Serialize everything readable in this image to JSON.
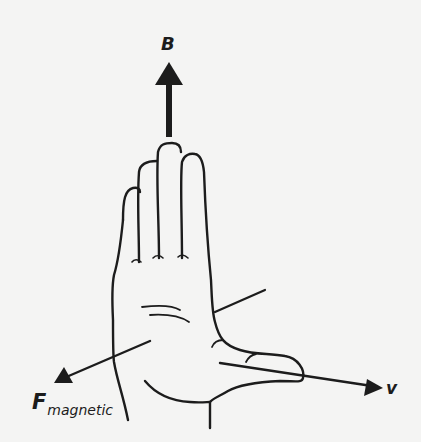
{
  "diagram": {
    "labels": {
      "magnetic_field": "B",
      "velocity": "v",
      "force_main": "F",
      "force_subscript": "magnetic"
    },
    "vectors": [
      {
        "name": "B",
        "direction": "up",
        "style": "thick"
      },
      {
        "name": "v",
        "direction": "right-down"
      },
      {
        "name": "F_magnetic",
        "direction": "left-down"
      }
    ],
    "colors": {
      "ink": "#1c1c1c",
      "background": "#f4f4f3"
    }
  }
}
